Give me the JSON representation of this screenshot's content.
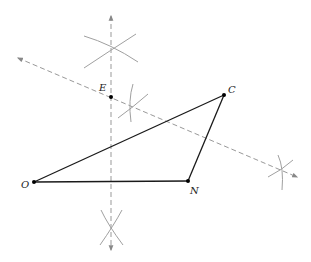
{
  "diagram": {
    "type": "geometric construction",
    "points": [
      {
        "name": "O",
        "x": 34,
        "y": 182,
        "label_dx": -13,
        "label_dy": 6
      },
      {
        "name": "N",
        "x": 188,
        "y": 181,
        "label_dx": 2,
        "label_dy": 13
      },
      {
        "name": "C",
        "x": 224,
        "y": 95,
        "label_dx": 4,
        "label_dy": -2
      },
      {
        "name": "E",
        "x": 111,
        "y": 97,
        "label_dx": -12,
        "label_dy": -6
      }
    ],
    "segments": [
      [
        "O",
        "N"
      ],
      [
        "N",
        "C"
      ],
      [
        "C",
        "O"
      ]
    ],
    "colors": {
      "segment": "#1a1a1a",
      "construction": "#9a9a9a",
      "point": "#000000"
    }
  }
}
